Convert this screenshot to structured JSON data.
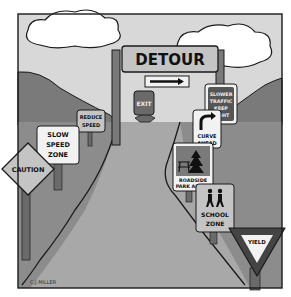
{
  "illustration": {
    "description": "Cartoon of a road with many traffic signs",
    "colors": {
      "sky": "#d8d8d8",
      "hills": "#7a7a7a",
      "road": "#9c9c9c",
      "grass": "#bdbdbd",
      "outline": "#1a1a1a",
      "sign_face": "#f2f2f2",
      "dark_sign": "#555555",
      "post": "#6a6a6a"
    },
    "signs": {
      "detour": "DETOUR",
      "exit": "EXIT",
      "slower_traffic": [
        "SLOWER",
        "TRAFFIC",
        "KEEP",
        "RIGHT"
      ],
      "reduce_speed": [
        "REDUCE",
        "SPEED"
      ],
      "slow_speed_zone": [
        "SLOW",
        "SPEED",
        "ZONE"
      ],
      "curve_ahead": [
        "CURVE",
        "AHEAD"
      ],
      "caution": "CAUTION",
      "roadside_park": [
        "ROADSIDE",
        "PARK AHEAD"
      ],
      "school_zone": [
        "SCHOOL",
        "ZONE"
      ],
      "yield": "YIELD"
    },
    "signature": "C.J.MILLER"
  }
}
